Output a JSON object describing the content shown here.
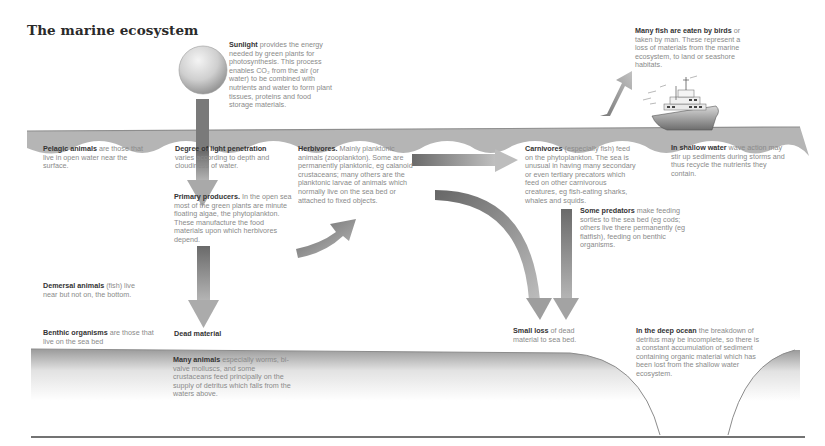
{
  "title": "The marine ecosystem",
  "colors": {
    "water": "#b3b3b3",
    "arrow_dark": "#6e6e6e",
    "arrow_light": "#b8b8b8",
    "heading_text": "#333333",
    "body_text": "#8a8a8a"
  },
  "labels": {
    "sunlight": {
      "head": "Sunlight",
      "body": " provides the energy needed by green plants for photosynthesis. This process enables CO₂ from the air (or water) to be combined with nutrients and water to form plant tissues, proteins and food storage materials."
    },
    "birds": {
      "head": "Many fish are eaten by birds",
      "body": " or taken by man. These represent a loss of materials from the marine ecosystem, to land or seashore habitats."
    },
    "pelagic": {
      "head": "Pelagic animals",
      "body": " are those that live in open water near the surface."
    },
    "light": {
      "head": "Degree of light penetration",
      "body": " varies according to depth and cloudiness of water."
    },
    "herbivores": {
      "head": "Herbivores.",
      "body": " Mainly planktonic animals (zooplankton). Some are permanently planktonic, eg calanoid crustaceans; many others are the planktonic larvae of animals which normally live on the sea bed or attached to fixed objects."
    },
    "carnivores": {
      "head": "Carnivores",
      "body": " (especially fish) feed on the phytoplankton. The sea is unusual in having many secondary or even tertiary precators which feed on other carnivorous creatures, eg fish-eating sharks, whales and squids."
    },
    "shallow": {
      "head": "In shallow water",
      "body": " wave action may stir up sediments during storms and thus recycle the nutrients they contain."
    },
    "primary": {
      "head": "Primary producers.",
      "body": " In the open sea most of the green plants are minute floating algae, the phytoplankton. These manufacture the food materials upon which herbivores depend."
    },
    "predators": {
      "head": "Some predators",
      "body": " make feeding sorties to the sea bed (eg cods; others live there permanently (eg flatfish), feeding on benthic organisms."
    },
    "demersal": {
      "head": "Demersal animals",
      "body": " (fish) live near but not on, the bottom."
    },
    "benthic": {
      "head": "Benthic organisms",
      "body": " are those that live on the sea bed"
    },
    "dead": {
      "head": "Dead material",
      "body": ""
    },
    "small_loss": {
      "head": "Small loss",
      "body": " of dead material to sea bed."
    },
    "deep_ocean": {
      "head": "In the deep ocean",
      "body": " the breakdown of detritus may be incomplete, so there is a constant accumulation of sediment containing organic material which has been lost from the shallow water ecosystem."
    },
    "many_animals": {
      "head": "Many animals",
      "body": " especially worms, bi-valve molluscs, and some crustaceans feed principally on the supply of detritus which falls from the waters above."
    }
  },
  "icons": [
    "sun-icon",
    "ship-icon",
    "arrow-icon"
  ]
}
